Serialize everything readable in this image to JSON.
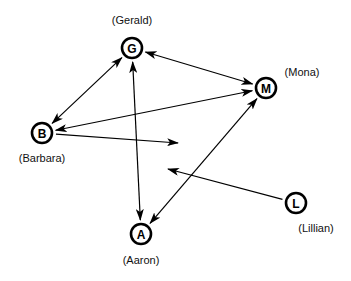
{
  "diagram": {
    "type": "directed-graph",
    "nodes": [
      {
        "id": "G",
        "letter": "G",
        "name": "(Gerald)",
        "x": 132,
        "y": 48,
        "label_x": 132,
        "label_y": 14
      },
      {
        "id": "M",
        "letter": "M",
        "name": "(Mona)",
        "x": 266,
        "y": 88,
        "label_x": 302,
        "label_y": 66
      },
      {
        "id": "B",
        "letter": "B",
        "name": "(Barbara)",
        "x": 42,
        "y": 133,
        "label_x": 42,
        "label_y": 152
      },
      {
        "id": "A",
        "letter": "A",
        "name": "(Aaron)",
        "x": 141,
        "y": 234,
        "label_x": 141,
        "label_y": 254
      },
      {
        "id": "L",
        "letter": "L",
        "name": "(Lillian)",
        "x": 296,
        "y": 203,
        "label_x": 316,
        "label_y": 222
      }
    ],
    "edges": [
      {
        "from": "G",
        "to": "B",
        "bidirectional": true
      },
      {
        "from": "G",
        "to": "M",
        "bidirectional": true
      },
      {
        "from": "G",
        "to": "A",
        "bidirectional": true
      },
      {
        "from": "M",
        "to": "B",
        "bidirectional": true
      },
      {
        "from": "M",
        "to": "A",
        "bidirectional": true
      },
      {
        "from": "B",
        "to_point": [
          178,
          143
        ],
        "bidirectional": false
      },
      {
        "from": "L",
        "to_point": [
          168,
          169
        ],
        "bidirectional": false
      }
    ]
  }
}
